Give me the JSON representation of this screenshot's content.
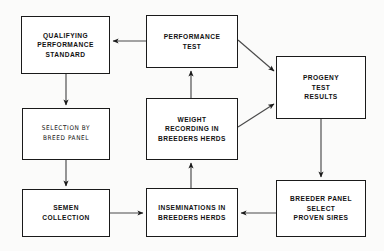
{
  "diagram": {
    "type": "flowchart",
    "stroke_color": "#1a1a1a",
    "box_fill": "#ffffff",
    "background": "#fbfbfa",
    "nodes": [
      {
        "id": "qualifying-performance-standard",
        "lines": [
          "QUALIFYING",
          "PERFORMANCE",
          "STANDARD"
        ],
        "x": 21,
        "y": 16,
        "w": 89,
        "h": 58
      },
      {
        "id": "performance-test",
        "lines": [
          "PERFORMANCE",
          "TEST"
        ],
        "x": 146,
        "y": 15,
        "w": 92,
        "h": 53
      },
      {
        "id": "progeny-test-results",
        "lines": [
          "PROGENY",
          "TEST",
          "RESULTS"
        ],
        "x": 276,
        "y": 56,
        "w": 90,
        "h": 63
      },
      {
        "id": "selection-by-breed-panel",
        "lines": [
          "SELECTION BY",
          "BREED PANEL"
        ],
        "x": 22,
        "y": 108,
        "w": 88,
        "h": 52
      },
      {
        "id": "weight-recording-breeders-herds",
        "lines": [
          "WEIGHT",
          "RECORDING  IN",
          "BREEDERS  HERDS"
        ],
        "x": 146,
        "y": 98,
        "w": 92,
        "h": 62
      },
      {
        "id": "semen-collection",
        "lines": [
          "SEMEN",
          "COLLECTION"
        ],
        "x": 22,
        "y": 189,
        "w": 88,
        "h": 48
      },
      {
        "id": "inseminations-breeders-herds",
        "lines": [
          "INSEMINATIONS  IN",
          "BREEDERS  HERDS"
        ],
        "x": 146,
        "y": 188,
        "w": 92,
        "h": 49
      },
      {
        "id": "breeder-panel-select-proven-sires",
        "lines": [
          "BREEDER PANEL",
          "SELECT",
          "PROVEN  SIRES"
        ],
        "x": 276,
        "y": 180,
        "w": 90,
        "h": 57
      }
    ],
    "edges": [
      {
        "id": "performance-test-to-qualifying-standard",
        "from": "performance-test",
        "to": "qualifying-performance-standard",
        "direction": "left",
        "points": "146,41 110,41"
      },
      {
        "id": "performance-test-to-progeny-results",
        "from": "performance-test",
        "to": "progeny-test-results",
        "direction": "down-right",
        "points": "238,40 276,73"
      },
      {
        "id": "weight-recording-to-progeny-results",
        "from": "weight-recording-breeders-herds",
        "to": "progeny-test-results",
        "direction": "up-right",
        "points": "238,126 276,102"
      },
      {
        "id": "weight-recording-to-performance-test",
        "from": "weight-recording-breeders-herds",
        "to": "performance-test",
        "direction": "up",
        "points": "191,98 191,68"
      },
      {
        "id": "inseminations-to-weight-recording",
        "from": "inseminations-breeders-herds",
        "to": "weight-recording-breeders-herds",
        "direction": "up",
        "points": "191,188 191,160"
      },
      {
        "id": "qualifying-standard-to-selection-breed-panel",
        "from": "qualifying-performance-standard",
        "to": "selection-by-breed-panel",
        "direction": "down",
        "points": "66,74 66,108"
      },
      {
        "id": "selection-breed-panel-to-semen-collection",
        "from": "selection-by-breed-panel",
        "to": "semen-collection",
        "direction": "down",
        "points": "66,160 66,189"
      },
      {
        "id": "semen-collection-to-inseminations",
        "from": "semen-collection",
        "to": "inseminations-breeders-herds",
        "direction": "right",
        "points": "110,213 146,213"
      },
      {
        "id": "progeny-results-to-breeder-panel",
        "from": "progeny-test-results",
        "to": "breeder-panel-select-proven-sires",
        "direction": "down",
        "points": "321,119 321,180"
      },
      {
        "id": "breeder-panel-to-inseminations",
        "from": "breeder-panel-select-proven-sires",
        "to": "inseminations-breeders-herds",
        "direction": "left",
        "points": "276,213 238,213"
      }
    ]
  }
}
